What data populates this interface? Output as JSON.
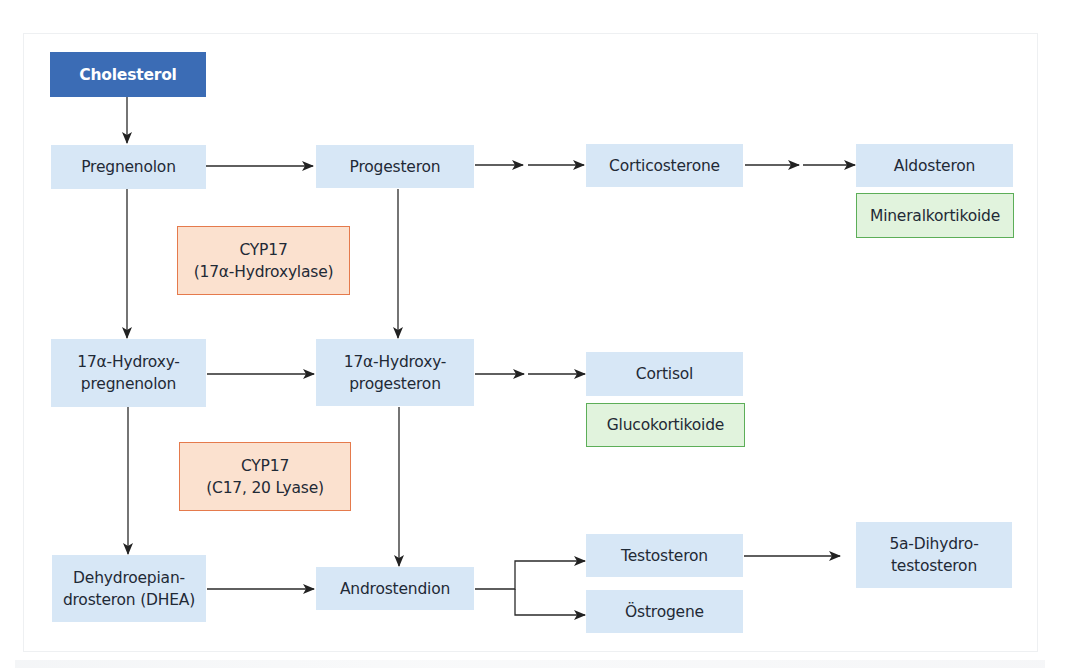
{
  "diagram": {
    "type": "steroid-biosynthesis-pathway",
    "colors": {
      "root_fill": "#3b6cb5",
      "compound_fill": "#d7e7f6",
      "enzyme_fill": "#fbe1cf",
      "enzyme_border": "#e57a4c",
      "class_fill": "#e1f3dd",
      "class_border": "#5cae58",
      "arrow": "#222222"
    },
    "nodes": {
      "cholesterol": "Cholesterol",
      "pregnenolon": "Pregnenolon",
      "progesteron": "Progesteron",
      "corticosterone": "Corticosterone",
      "aldosteron": "Aldosteron",
      "hydroxypregnenolon_l1": "17α-Hydroxy-",
      "hydroxypregnenolon_l2": "pregnenolon",
      "hydroxyprogesteron_l1": "17α-Hydroxy-",
      "hydroxyprogesteron_l2": "progesteron",
      "cortisol": "Cortisol",
      "dhea_l1": "Dehydroepian-",
      "dhea_l2": "drosteron (DHEA)",
      "androstendion": "Androstendion",
      "testosteron": "Testosteron",
      "oestrogene": "Östrogene",
      "dihydrotestosteron_l1": "5a-Dihydro-",
      "dihydrotestosteron_l2": "testosteron"
    },
    "enzymes": {
      "cyp17_hydroxylase_l1": "CYP17",
      "cyp17_hydroxylase_l2": "(17α-Hydroxylase)",
      "cyp17_lyase_l1": "CYP17",
      "cyp17_lyase_l2": "(C17, 20 Lyase)"
    },
    "classes": {
      "mineralkortikoide": "Mineralkortikoide",
      "glucokortikoide": "Glucokortikoide"
    },
    "edges": [
      {
        "from": "Cholesterol",
        "to": "Pregnenolon",
        "steps": 1
      },
      {
        "from": "Pregnenolon",
        "to": "Progesteron",
        "steps": 1
      },
      {
        "from": "Progesteron",
        "to": "Corticosterone",
        "steps": 2
      },
      {
        "from": "Corticosterone",
        "to": "Aldosteron",
        "steps": 2
      },
      {
        "from": "Pregnenolon",
        "to": "17α-Hydroxypregnenolon",
        "steps": 1
      },
      {
        "from": "Progesteron",
        "to": "17α-Hydroxyprogesteron",
        "steps": 1
      },
      {
        "from": "17α-Hydroxypregnenolon",
        "to": "17α-Hydroxyprogesteron",
        "steps": 1
      },
      {
        "from": "17α-Hydroxyprogesteron",
        "to": "Cortisol",
        "steps": 2
      },
      {
        "from": "17α-Hydroxypregnenolon",
        "to": "Dehydroepiandrosteron (DHEA)",
        "steps": 1
      },
      {
        "from": "17α-Hydroxyprogesteron",
        "to": "Androstendion",
        "steps": 1
      },
      {
        "from": "Dehydroepiandrosteron (DHEA)",
        "to": "Androstendion",
        "steps": 1
      },
      {
        "from": "Androstendion",
        "to": "Testosteron",
        "steps": 1
      },
      {
        "from": "Androstendion",
        "to": "Östrogene",
        "steps": 1
      },
      {
        "from": "Testosteron",
        "to": "5a-Dihydrotestosteron",
        "steps": 1
      }
    ]
  }
}
